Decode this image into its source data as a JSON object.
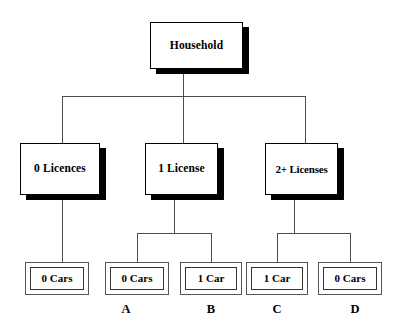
{
  "diagram": {
    "type": "tree",
    "title_node": "Household",
    "root": {
      "label": "Household",
      "x": 150,
      "y": 22,
      "w": 93,
      "h": 47
    },
    "level2": [
      {
        "label": "0 Licences",
        "x": 20,
        "y": 143,
        "w": 80,
        "h": 52
      },
      {
        "label": "1 License",
        "x": 145,
        "y": 143,
        "w": 73,
        "h": 52
      },
      {
        "label": "2+ Licenses",
        "x": 265,
        "y": 143,
        "w": 73,
        "h": 52
      }
    ],
    "leaves": [
      {
        "label": "0 Cars",
        "x": 25,
        "y": 262,
        "w": 64,
        "h": 33,
        "caption": ""
      },
      {
        "label": "0 Cars",
        "x": 105,
        "y": 262,
        "w": 64,
        "h": 33,
        "caption": "A"
      },
      {
        "label": "1 Car",
        "x": 180,
        "y": 262,
        "w": 62,
        "h": 33,
        "caption": "B"
      },
      {
        "label": "1 Car",
        "x": 246,
        "y": 262,
        "w": 62,
        "h": 33,
        "caption": "C"
      },
      {
        "label": "0 Cars",
        "x": 318,
        "y": 262,
        "w": 64,
        "h": 33,
        "caption": "D"
      }
    ],
    "captions": [
      {
        "text": "A",
        "cx": 126,
        "y": 303
      },
      {
        "text": "B",
        "cx": 211,
        "y": 303
      },
      {
        "text": "C",
        "cx": 277,
        "y": 303
      },
      {
        "text": "D",
        "cx": 355,
        "y": 303
      }
    ]
  }
}
